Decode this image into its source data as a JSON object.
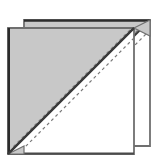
{
  "figure": {
    "title": "Half-square triangle stitching diagram",
    "canvas": {
      "width": 158,
      "height": 162
    },
    "colors": {
      "background": "#ffffff",
      "shaded_fabric": "#c8c8c8",
      "plain_fabric": "#ffffff",
      "outline_dark": "#2b2b2b",
      "outline_mid": "#6f6f6f",
      "outline_light": "#8a8a8a",
      "dashed_line": "#7a7a7a"
    },
    "stroke_widths": {
      "outline": 2.0,
      "diagonal": 2.0,
      "dashed": 1.2
    },
    "dash_pattern": "3 3",
    "squares": [
      {
        "name": "back-square",
        "label": "Upper-right square",
        "corners": [
          [
            24,
            20
          ],
          [
            150,
            20
          ],
          [
            150,
            146
          ],
          [
            24,
            146
          ]
        ],
        "diagonal": {
          "from": [
            150,
            20
          ],
          "to": [
            24,
            146
          ]
        },
        "shaded_half": [
          [
            24,
            20
          ],
          [
            150,
            20
          ],
          [
            24,
            146
          ]
        ],
        "plain_half": [
          [
            150,
            20
          ],
          [
            150,
            146
          ],
          [
            24,
            146
          ]
        ]
      },
      {
        "name": "front-square",
        "label": "Lower-left square",
        "corners": [
          [
            8,
            28
          ],
          [
            134,
            28
          ],
          [
            134,
            154
          ],
          [
            8,
            154
          ]
        ],
        "diagonal": {
          "from": [
            134,
            28
          ],
          "to": [
            8,
            154
          ]
        },
        "shaded_half": [
          [
            8,
            28
          ],
          [
            134,
            28
          ],
          [
            8,
            154
          ]
        ],
        "plain_half": [
          [
            134,
            28
          ],
          [
            134,
            154
          ],
          [
            8,
            154
          ]
        ]
      }
    ],
    "sewing_lines": [
      {
        "name": "stitch-line-upper-back",
        "from": [
          146,
          22
        ],
        "to": [
          26,
          142
        ],
        "style": "dashed"
      },
      {
        "name": "stitch-line-lower-back",
        "from": [
          150,
          30
        ],
        "to": [
          34,
          146
        ],
        "style": "dashed"
      },
      {
        "name": "stitch-line-upper-front",
        "from": [
          130,
          30
        ],
        "to": [
          12,
          148
        ],
        "style": "dashed"
      },
      {
        "name": "stitch-line-lower-front",
        "from": [
          134,
          38
        ],
        "to": [
          18,
          154
        ],
        "style": "dashed"
      }
    ],
    "corner_tabs": [
      {
        "name": "corner-tab-top-right",
        "points": [
          [
            134,
            28
          ],
          [
            150,
            20
          ],
          [
            150,
            36
          ]
        ]
      },
      {
        "name": "corner-tab-bottom-left",
        "points": [
          [
            24,
            146
          ],
          [
            8,
            154
          ],
          [
            24,
            154
          ]
        ]
      }
    ],
    "legend": {
      "shaded_meaning": "Shaded fabric half",
      "plain_meaning": "Plain fabric half",
      "dashed_meaning": "Stitching line",
      "solid_meaning": "Cutting / fold diagonal"
    }
  }
}
